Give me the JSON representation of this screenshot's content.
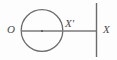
{
  "figure": {
    "type": "geometry-diagram",
    "background_color": "#fdfdfd",
    "stroke_color": "#6b6b6b",
    "label_color": "#4a4a4a",
    "labels": {
      "origin": "O",
      "x_prime": "X′",
      "x_axis": "X"
    },
    "elements": {
      "circle": {
        "name": "circle",
        "center_x": 42,
        "center_y": 30.5,
        "radius": 20.8
      },
      "center_point": {
        "name": "circle-center-dot",
        "x": 42,
        "y": 31,
        "radius": 0.9
      },
      "horizontal_line": {
        "name": "horizontal-axis",
        "x1": 21,
        "y1": 31,
        "x2": 97,
        "y2": 31
      },
      "vertical_line": {
        "name": "vertical-line",
        "x1": 96.5,
        "y1": 3,
        "x2": 96.5,
        "y2": 57
      }
    }
  }
}
